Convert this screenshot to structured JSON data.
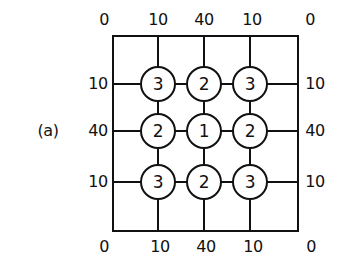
{
  "figure": {
    "label": "(a)",
    "top_values": [
      "0",
      "10",
      "40",
      "10",
      "0"
    ],
    "bottom_values": [
      "0",
      "10",
      "40",
      "10",
      "0"
    ],
    "left_values": [
      "10",
      "40",
      "10"
    ],
    "right_values": [
      "10",
      "40",
      "10"
    ],
    "nodes": [
      [
        "3",
        "2",
        "3"
      ],
      [
        "2",
        "1",
        "2"
      ],
      [
        "3",
        "2",
        "3"
      ]
    ]
  }
}
